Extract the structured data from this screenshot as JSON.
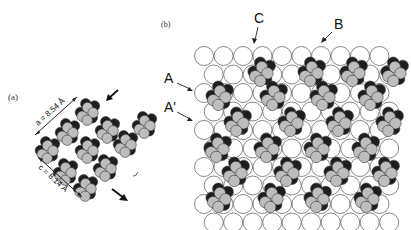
{
  "figure": {
    "panel_a": {
      "label": "(a)",
      "dim_a": "a = 8.54 Å",
      "dim_c": "c = 8.14 Å"
    },
    "panel_b": {
      "label": "(b)",
      "markers": {
        "C": "C",
        "B": "B",
        "A": "A",
        "A_prime": "A'"
      }
    },
    "colors": {
      "dark_atom": "#1e1e1e",
      "light_atom": "#bdbdbd",
      "outline": "#3a3a3a",
      "white_atom": "#ffffff"
    }
  }
}
